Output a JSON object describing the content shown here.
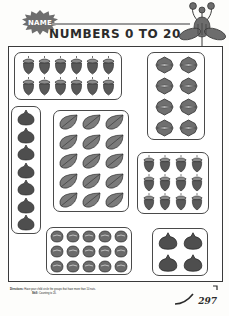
{
  "header": {
    "name_label": "NAME",
    "name_rule_icon": "write-on-line",
    "title": "NUMBERS 0 TO 20",
    "decoration_icon": "flower-plant-icon"
  },
  "worksheet": {
    "groups": [
      {
        "id": "acorn12",
        "item": "acorn",
        "item_icon": "acorn-icon",
        "rows": 2,
        "cols": 6,
        "count": 12
      },
      {
        "id": "walnut8",
        "item": "walnut",
        "item_icon": "walnut-icon",
        "rows": 4,
        "cols": 2,
        "count": 8
      },
      {
        "id": "fig7",
        "item": "fig",
        "item_icon": "fig-icon",
        "rows": 7,
        "cols": 1,
        "count": 7
      },
      {
        "id": "leaf15",
        "item": "leaf",
        "item_icon": "leaf-icon",
        "rows": 5,
        "cols": 3,
        "count": 15
      },
      {
        "id": "acorn12b",
        "item": "acorn",
        "item_icon": "acorn-icon",
        "rows": 3,
        "cols": 4,
        "count": 12
      },
      {
        "id": "nut15",
        "item": "nut",
        "item_icon": "nut-icon",
        "rows": 3,
        "cols": 5,
        "count": 15
      },
      {
        "id": "fig4",
        "item": "fig",
        "item_icon": "fig-icon",
        "rows": 2,
        "cols": 2,
        "count": 4
      }
    ]
  },
  "footer": {
    "directions_label": "Directions:",
    "directions_text": "Have your child circle the groups that have more than 10 nuts.",
    "skill_label": "Skill:",
    "skill_text": "Counting to 20.",
    "page_number": "297"
  },
  "colors": {
    "ink": "#2b2b2b",
    "border": "#4a4a4a",
    "fill_dark": "#5a5a5a",
    "fill_mid": "#7d7d7d",
    "paper": "#ffffff"
  }
}
